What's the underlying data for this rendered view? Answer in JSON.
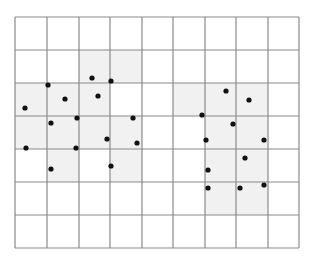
{
  "diagram": {
    "type": "grid-point-clusters",
    "grid": {
      "columns": 9,
      "rows": 7,
      "x_lines": [
        15,
        47,
        79,
        110,
        142,
        173,
        205,
        236,
        268,
        299
      ],
      "y_lines": [
        17,
        50,
        83,
        116,
        149,
        182,
        215,
        248
      ],
      "line_color": "#8a8a8a",
      "background": "#ffffff"
    },
    "shade_color": "#f1f1f1",
    "clusters": [
      {
        "name": "left-cluster",
        "shaded_cells": [
          [
            2,
            1
          ],
          [
            3,
            1
          ],
          [
            0,
            2
          ],
          [
            1,
            2
          ],
          [
            2,
            2
          ],
          [
            0,
            3
          ],
          [
            1,
            3
          ],
          [
            2,
            3
          ],
          [
            3,
            3
          ],
          [
            1,
            4
          ],
          [
            3,
            4
          ]
        ],
        "points": [
          [
            92,
            78
          ],
          [
            111,
            81
          ],
          [
            48,
            85
          ],
          [
            98,
            96
          ],
          [
            65,
            99
          ],
          [
            25,
            108
          ],
          [
            77,
            118
          ],
          [
            133,
            118
          ],
          [
            51,
            123
          ],
          [
            107,
            139
          ],
          [
            137,
            143
          ],
          [
            26,
            148
          ],
          [
            76,
            148
          ],
          [
            111,
            166
          ],
          [
            51,
            169
          ]
        ]
      },
      {
        "name": "right-cluster",
        "shaded_cells": [
          [
            5,
            2
          ],
          [
            6,
            2
          ],
          [
            7,
            2
          ],
          [
            6,
            3
          ],
          [
            7,
            3
          ],
          [
            6,
            4
          ],
          [
            7,
            4
          ],
          [
            6,
            5
          ],
          [
            7,
            5
          ]
        ],
        "points": [
          [
            226,
            91
          ],
          [
            249,
            100
          ],
          [
            202,
            115
          ],
          [
            233,
            124
          ],
          [
            206,
            140
          ],
          [
            264,
            140
          ],
          [
            245,
            158
          ],
          [
            208,
            170
          ],
          [
            264,
            185
          ],
          [
            208,
            188
          ],
          [
            240,
            188
          ]
        ]
      }
    ],
    "point_color": "#111111",
    "point_radius": 2.6
  }
}
